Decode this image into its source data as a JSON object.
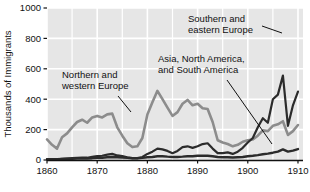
{
  "chart_data": {
    "type": "line",
    "title": "",
    "subtitle": "",
    "xlabel": "",
    "ylabel": "Thousands of Immigrants",
    "xlim": [
      1860,
      1911
    ],
    "ylim": [
      0,
      1000
    ],
    "yticks": [
      0,
      200,
      400,
      600,
      800,
      1000
    ],
    "ytick_labels": [
      "0",
      "200",
      "400",
      "600",
      "800",
      "1000"
    ],
    "xticks": [
      1860,
      1870,
      1880,
      1890,
      1900,
      1910
    ],
    "xtick_labels": [
      "1860",
      "1870",
      "1880",
      "1890",
      "1900",
      "1910"
    ],
    "grid": true,
    "legend_position": "annotations-inline",
    "plot_background": "#e6e6e6",
    "gridline_color": "#ffffff",
    "series": [
      {
        "name": "Northern and western Europe",
        "color": "#8c8c8c",
        "line_width": 2.6,
        "x": [
          1860,
          1861,
          1862,
          1863,
          1864,
          1865,
          1866,
          1867,
          1868,
          1869,
          1870,
          1871,
          1872,
          1873,
          1874,
          1875,
          1876,
          1877,
          1878,
          1879,
          1880,
          1881,
          1882,
          1883,
          1884,
          1885,
          1886,
          1887,
          1888,
          1889,
          1890,
          1891,
          1892,
          1893,
          1894,
          1895,
          1896,
          1897,
          1898,
          1899,
          1900,
          1901,
          1902,
          1903,
          1904,
          1905,
          1906,
          1907,
          1908,
          1909,
          1910
        ],
        "values": [
          135,
          100,
          75,
          150,
          175,
          215,
          250,
          265,
          245,
          280,
          290,
          280,
          300,
          305,
          215,
          160,
          110,
          85,
          90,
          145,
          300,
          380,
          455,
          400,
          345,
          290,
          315,
          370,
          395,
          360,
          370,
          340,
          335,
          250,
          130,
          115,
          105,
          90,
          100,
          120,
          130,
          135,
          160,
          195,
          190,
          225,
          235,
          255,
          165,
          190,
          230
        ]
      },
      {
        "name": "Southern and eastern Europe",
        "color": "#2b2b2b",
        "line_width": 2.2,
        "x": [
          1860,
          1861,
          1862,
          1863,
          1864,
          1865,
          1866,
          1867,
          1868,
          1869,
          1870,
          1871,
          1872,
          1873,
          1874,
          1875,
          1876,
          1877,
          1878,
          1879,
          1880,
          1881,
          1882,
          1883,
          1884,
          1885,
          1886,
          1887,
          1888,
          1889,
          1890,
          1891,
          1892,
          1893,
          1894,
          1895,
          1896,
          1897,
          1898,
          1899,
          1900,
          1901,
          1902,
          1903,
          1904,
          1905,
          1906,
          1907,
          1908,
          1909,
          1910
        ],
        "values": [
          5,
          5,
          5,
          8,
          10,
          12,
          14,
          16,
          15,
          20,
          25,
          28,
          35,
          40,
          30,
          25,
          18,
          12,
          12,
          20,
          40,
          55,
          75,
          70,
          60,
          45,
          60,
          85,
          90,
          80,
          90,
          105,
          110,
          75,
          45,
          45,
          50,
          40,
          55,
          80,
          115,
          145,
          215,
          275,
          245,
          400,
          430,
          555,
          225,
          360,
          450
        ]
      },
      {
        "name": "Asia, North America, and South America",
        "color": "#2b2b2b",
        "line_width": 2.4,
        "x": [
          1860,
          1861,
          1862,
          1863,
          1864,
          1865,
          1866,
          1867,
          1868,
          1869,
          1870,
          1871,
          1872,
          1873,
          1874,
          1875,
          1876,
          1877,
          1878,
          1879,
          1880,
          1881,
          1882,
          1883,
          1884,
          1885,
          1886,
          1887,
          1888,
          1889,
          1890,
          1891,
          1892,
          1893,
          1894,
          1895,
          1896,
          1897,
          1898,
          1899,
          1900,
          1901,
          1902,
          1903,
          1904,
          1905,
          1906,
          1907,
          1908,
          1909,
          1910
        ],
        "values": [
          6,
          6,
          6,
          7,
          8,
          8,
          10,
          10,
          10,
          12,
          15,
          15,
          18,
          20,
          18,
          16,
          14,
          12,
          12,
          14,
          18,
          20,
          25,
          25,
          22,
          20,
          20,
          22,
          25,
          25,
          28,
          28,
          28,
          25,
          20,
          18,
          18,
          16,
          18,
          20,
          25,
          28,
          32,
          38,
          42,
          48,
          55,
          70,
          55,
          62,
          72
        ]
      }
    ],
    "combined_top_line_note": "Dark upper trace rises steeply after 1900 peaking near 950 in 1907",
    "peak_annotation": {
      "year": 1907,
      "value": 950
    },
    "annotations": [
      {
        "id": "northern-western-europe",
        "text_line1": "Northern and",
        "text_line2": "western Europe",
        "text_x": 62,
        "text_y": 78,
        "leader": {
          "x1": 118,
          "y1": 96,
          "x2": 131,
          "y2": 112
        }
      },
      {
        "id": "southern-eastern-europe",
        "text_line1": "Southern and",
        "text_line2": "eastern Europe",
        "text_x": 188,
        "text_y": 22,
        "leader": {
          "x1": 262,
          "y1": 26,
          "x2": 282,
          "y2": 33
        }
      },
      {
        "id": "asia-north-south-america",
        "text_line1": "Asia, North America,",
        "text_line2": "and South America",
        "text_x": 158,
        "text_y": 62,
        "leader": {
          "x1": 227,
          "y1": 80,
          "x2": 272,
          "y2": 144
        }
      }
    ]
  }
}
